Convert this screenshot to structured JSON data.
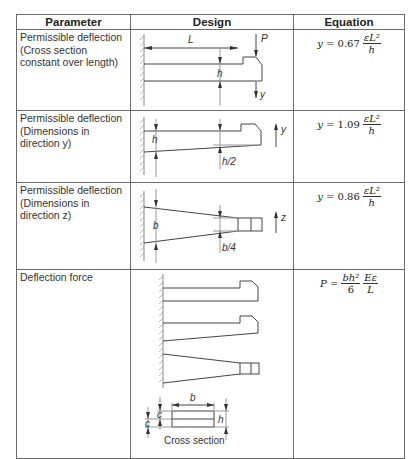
{
  "table": {
    "headers": [
      "Parameter",
      "Design",
      "Equation"
    ],
    "rows": [
      {
        "parameter": [
          "Permissible deflection",
          "(Cross section",
          "constant over length)"
        ],
        "design_labels": {
          "length": "L",
          "force": "P",
          "height": "h",
          "deflection": "y"
        },
        "equation": {
          "lhs": "y",
          "eq": "=",
          "coef": "0.67",
          "num": "εL²",
          "den": "h"
        }
      },
      {
        "parameter": [
          "Permissible deflection",
          "(Dimensions in",
          "direction y)"
        ],
        "design_labels": {
          "height": "h",
          "half_height": "h/2",
          "deflection": "y"
        },
        "equation": {
          "lhs": "y",
          "eq": "=",
          "coef": "1.09",
          "num": "εL²",
          "den": "h"
        }
      },
      {
        "parameter": [
          "Permissible deflection",
          "(Dimensions in",
          "direction z)"
        ],
        "design_labels": {
          "width": "b",
          "quarter_width": "b/4",
          "deflection": "z"
        },
        "equation": {
          "lhs": "y",
          "eq": "=",
          "coef": "0.86",
          "num": "εL²",
          "den": "h"
        }
      },
      {
        "parameter": [
          "Deflection force"
        ],
        "design_labels": {
          "width": "b",
          "c_top": "c",
          "c_bottom": "c",
          "height": "h",
          "caption": "Cross section"
        },
        "equation": {
          "lhs": "P",
          "eq": "=",
          "num1": "bh²",
          "den1": "6",
          "num2": "Eε",
          "den2": "L"
        }
      }
    ]
  }
}
